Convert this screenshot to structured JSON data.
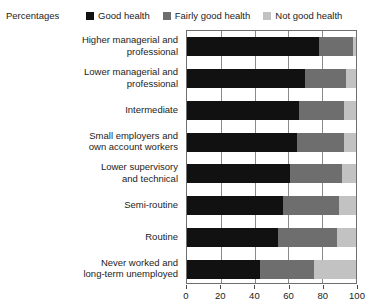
{
  "header": {
    "percentages_label": "Percentages"
  },
  "legend": {
    "items": [
      {
        "label": "Good health",
        "swatch_name": "legend-swatch-good-health",
        "color": "#111111"
      },
      {
        "label": "Fairly good health",
        "swatch_name": "legend-swatch-fairly-good-health",
        "color": "#6e6e6e"
      },
      {
        "label": "Not good health",
        "swatch_name": "legend-swatch-not-good-health",
        "color": "#c2c2c2"
      }
    ]
  },
  "axis": {
    "ticks": [
      {
        "value": 0,
        "label": "0"
      },
      {
        "value": 20,
        "label": "20"
      },
      {
        "value": 40,
        "label": "40"
      },
      {
        "value": 60,
        "label": "60"
      },
      {
        "value": 80,
        "label": "80"
      },
      {
        "value": 100,
        "label": "100"
      }
    ]
  },
  "chart_data": {
    "type": "bar",
    "orientation": "horizontal",
    "stacked": true,
    "title": "",
    "subtitle": "",
    "xlabel": "Percentages",
    "ylabel": "",
    "xlim": [
      0,
      100
    ],
    "grid": true,
    "legend_position": "top",
    "categories": [
      "Higher managerial and\nprofessional",
      "Lower managerial and\nprofessional",
      "Intermediate",
      "Small employers and\nown account workers",
      "Lower supervisory\nand technical",
      "Semi-routine",
      "Routine",
      "Never worked and\nlong-term unemployed"
    ],
    "series": [
      {
        "name": "Good health",
        "color": "#111111",
        "values": [
          78,
          70,
          66,
          65,
          61,
          57,
          54,
          43
        ]
      },
      {
        "name": "Fairly good health",
        "color": "#6e6e6e",
        "values": [
          20,
          24,
          27,
          28,
          31,
          33,
          35,
          32
        ]
      },
      {
        "name": "Not good health",
        "color": "#c2c2c2",
        "values": [
          2,
          6,
          7,
          7,
          8,
          10,
          11,
          25
        ]
      }
    ]
  }
}
